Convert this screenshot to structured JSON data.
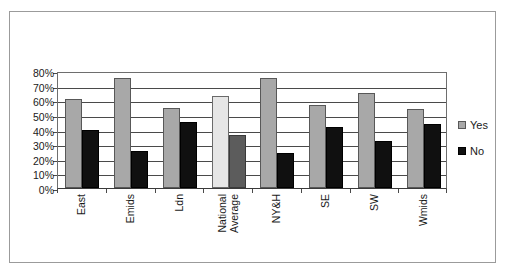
{
  "chart_data": {
    "type": "bar",
    "title": "",
    "subtitle": "",
    "xlabel": "",
    "ylabel": "",
    "ylim": [
      0,
      80
    ],
    "ytick_step": 10,
    "ytick_labels": [
      "80%",
      "70%",
      "60%",
      "50%",
      "40%",
      "30%",
      "20%",
      "10%",
      "0%"
    ],
    "ytick_values": [
      80,
      70,
      60,
      50,
      40,
      30,
      20,
      10,
      0
    ],
    "grid": "horizontal",
    "legend_position": "right",
    "categories": [
      "East",
      "Emids",
      "Ldn",
      "National Average",
      "NY&H",
      "SE",
      "SW",
      "Wmids"
    ],
    "series": [
      {
        "name": "Yes",
        "color": "#a8a8a8",
        "highlight_color": "#e6e6e6",
        "values": [
          61,
          75,
          55,
          63,
          75,
          57,
          65,
          54
        ]
      },
      {
        "name": "No",
        "color": "#101010",
        "highlight_color": "#5c5c5c",
        "values": [
          40,
          25,
          45,
          36,
          24,
          42,
          32,
          44
        ]
      }
    ],
    "highlighted_category": "National Average"
  },
  "legend": {
    "items": [
      {
        "label": "Yes",
        "swatch": "yes"
      },
      {
        "label": "No",
        "swatch": "no"
      }
    ]
  },
  "axis": {
    "y_labels": [
      "80%",
      "70%",
      "60%",
      "50%",
      "40%",
      "30%",
      "20%",
      "10%",
      "0%"
    ],
    "x_labels": [
      "East",
      "Emids",
      "Ldn",
      "National Average",
      "NY&H",
      "SE",
      "SW",
      "Wmids"
    ]
  }
}
